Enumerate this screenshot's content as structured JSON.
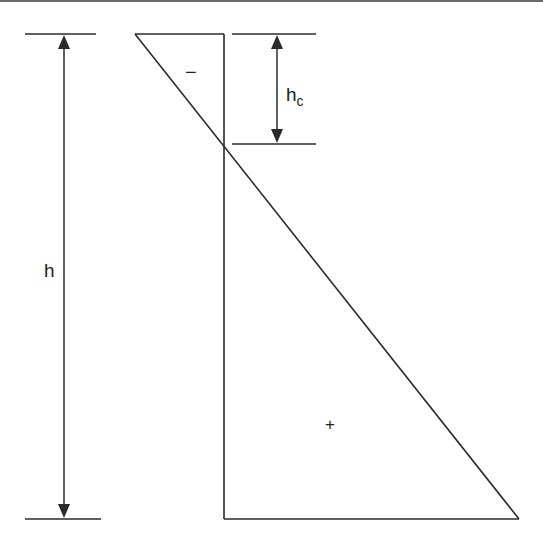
{
  "diagram": {
    "colors": {
      "line": "#2b2b2b",
      "text": "#222222",
      "background": "#ffffff",
      "top_rule": "#6a6a6a"
    },
    "dimensions": {
      "total_height": {
        "label": "h",
        "from_y": 34,
        "to_y": 519,
        "x": 64
      },
      "compression_depth": {
        "label_main": "h",
        "label_sub": "c",
        "from_y": 34,
        "to_y": 144,
        "x": 277
      }
    },
    "regions": {
      "negative": {
        "sign": "−",
        "x": 192,
        "y": 72
      },
      "positive": {
        "sign": "+",
        "x": 331,
        "y": 423
      }
    },
    "shape": {
      "top_edge": [
        [
          135,
          34
        ],
        [
          224,
          34
        ]
      ],
      "vertical_axis": [
        [
          224,
          34
        ],
        [
          224,
          519
        ]
      ],
      "bottom_edge": [
        [
          224,
          519
        ],
        [
          519,
          519
        ]
      ],
      "diagonal": [
        [
          135,
          34
        ],
        [
          519,
          519
        ]
      ]
    }
  }
}
